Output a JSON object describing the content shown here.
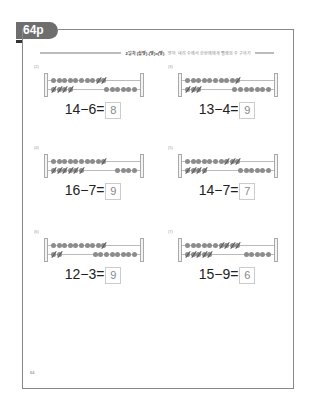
{
  "page_tab": "64p",
  "header": {
    "title": "2일차 (십몇)-(몇)=(몇)",
    "subtitle": "받아 내려 수에서 한번에에게 뺄셈의 수 구하기"
  },
  "problems": [
    {
      "label": "(2)",
      "expression": "14−6=",
      "answer": "8",
      "top_total": 10,
      "top_crossed": 2,
      "bottom_total": 10,
      "bottom_crossed": 4,
      "bottom_present": 4
    },
    {
      "label": "(3)",
      "expression": "13−4=",
      "answer": "9",
      "top_total": 10,
      "top_crossed": 1,
      "bottom_total": 10,
      "bottom_crossed": 3,
      "bottom_present": 3
    },
    {
      "label": "(4)",
      "expression": "16−7=",
      "answer": "9",
      "top_total": 10,
      "top_crossed": 1,
      "bottom_total": 10,
      "bottom_crossed": 6,
      "bottom_present": 6
    },
    {
      "label": "(5)",
      "expression": "14−7=",
      "answer": "7",
      "top_total": 10,
      "top_crossed": 3,
      "bottom_total": 10,
      "bottom_crossed": 4,
      "bottom_present": 4
    },
    {
      "label": "(6)",
      "expression": "12−3=",
      "answer": "9",
      "top_total": 10,
      "top_crossed": 1,
      "bottom_total": 10,
      "bottom_crossed": 2,
      "bottom_present": 2
    },
    {
      "label": "(7)",
      "expression": "15−9=",
      "answer": "6",
      "top_total": 10,
      "top_crossed": 4,
      "bottom_total": 10,
      "bottom_crossed": 5,
      "bottom_present": 5
    }
  ],
  "page_number": "64"
}
